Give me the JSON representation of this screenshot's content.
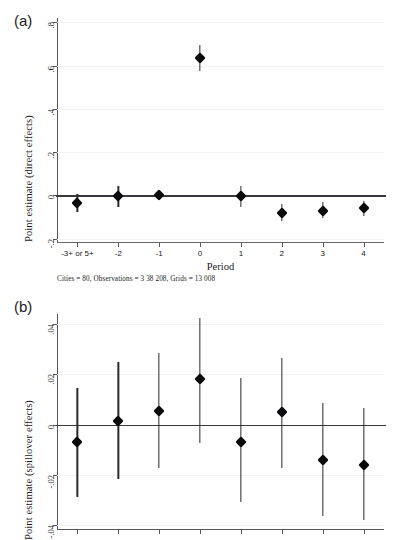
{
  "figure": {
    "ghost_header": "",
    "panels": [
      {
        "tag": "(a)",
        "note": "Cities = 80, Observations = 3 38 208, Grids = 13 008"
      },
      {
        "tag": "(b)",
        "note": ""
      }
    ]
  },
  "chart_data": [
    {
      "type": "scatter",
      "panel": "(a)",
      "title": "",
      "xlabel": "Period",
      "ylabel": "Point estimate (direct effects)",
      "categories": [
        "-3+ or 5+",
        "-2",
        "-1",
        "0",
        "1",
        "2",
        "3",
        "4"
      ],
      "values": [
        -0.035,
        -0.005,
        0.0,
        0.635,
        -0.005,
        -0.08,
        -0.07,
        -0.06
      ],
      "ci_low": [
        -0.075,
        -0.055,
        0.0,
        0.575,
        -0.055,
        -0.12,
        -0.105,
        -0.095
      ],
      "ci_high": [
        0.005,
        0.045,
        0.0,
        0.695,
        0.045,
        -0.04,
        -0.03,
        -0.025
      ],
      "yticks": [
        ".8",
        ".6",
        ".4",
        ".2",
        "0",
        "-.2"
      ],
      "ytick_values": [
        0.8,
        0.6,
        0.4,
        0.2,
        0.0,
        -0.2
      ],
      "ylim": [
        -0.22,
        0.82
      ],
      "xlim": [
        -0.5,
        7.5
      ],
      "grid": true,
      "reference_line": 0,
      "legend": "none"
    },
    {
      "type": "scatter",
      "panel": "(b)",
      "title": "",
      "xlabel": "",
      "ylabel": "Point estimate (spillover effects)",
      "categories": [
        "-3+ or 5+",
        "-2",
        "-1",
        "0",
        "1",
        "2",
        "3",
        "4"
      ],
      "values": [
        -0.007,
        0.0015,
        0.0055,
        0.018,
        -0.007,
        0.005,
        -0.014,
        -0.016
      ],
      "ci_low": [
        -0.029,
        -0.0215,
        -0.0175,
        -0.0075,
        -0.031,
        -0.0175,
        -0.0365,
        -0.038
      ],
      "ci_high": [
        0.0145,
        0.025,
        0.0285,
        0.0425,
        0.0185,
        0.0265,
        0.0085,
        0.0065
      ],
      "yticks": [
        ".04",
        ".02",
        "0",
        "-.02",
        "-.04"
      ],
      "ytick_values": [
        0.04,
        0.02,
        0.0,
        -0.02,
        -0.04
      ],
      "ylim": [
        -0.042,
        0.044
      ],
      "xlim": [
        -0.5,
        7.5
      ],
      "grid": true,
      "reference_line": 0,
      "legend": "none"
    }
  ]
}
